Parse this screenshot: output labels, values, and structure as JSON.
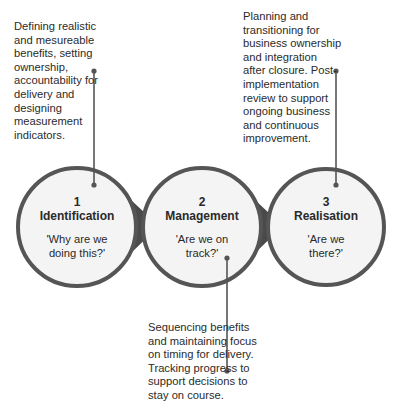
{
  "colors": {
    "border": "#555555",
    "arrow_fill": "#4a4a4a",
    "circle_fill": "#f4f4f4",
    "text": "#2b2b2b"
  },
  "stages": [
    {
      "number": "1",
      "name": "Identification",
      "question": "'Why are we\ndoing this?'"
    },
    {
      "number": "2",
      "name": "Management",
      "question": "'Are we on\ntrack?'"
    },
    {
      "number": "3",
      "name": "Realisation",
      "question": "'Are we\nthere?'"
    }
  ],
  "descriptions": [
    {
      "stage": "1",
      "text": "Defining realistic\nand mesureable\nbenefits, setting\nownership,\naccountability for\ndelivery and\ndesigning\nmeasurement\nindicators."
    },
    {
      "stage": "2",
      "text": "Sequencing benefits\nand maintaining focus\non timing for delivery.\nTracking progress to\nsupport decisions to\nstay on course."
    },
    {
      "stage": "3",
      "text": "Planning and\ntransitioning for\nbusiness ownership\nand integration\nafter closure. Post-\nimplementation\nreview to support\nongoing business\nand continuous\nimprovement."
    }
  ]
}
